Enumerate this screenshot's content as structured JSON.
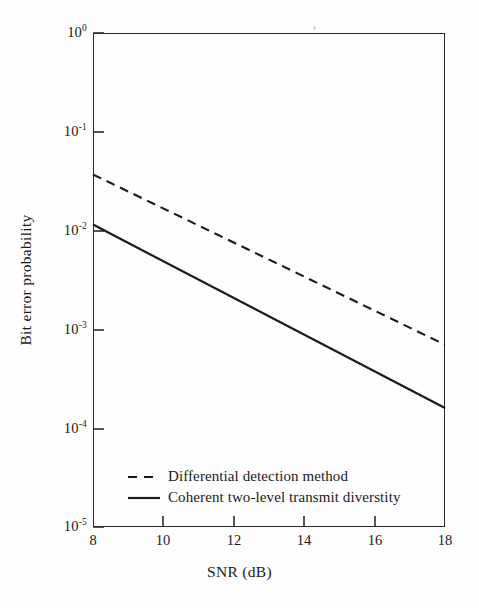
{
  "figure": {
    "background_color": "#fefefe",
    "ink_color": "#1a1a1a"
  },
  "chart_data": {
    "type": "line",
    "title": "",
    "subtitle": "",
    "xlabel": "SNR (dB)",
    "ylabel": "Bit error probability",
    "xscale": "linear",
    "yscale": "log",
    "xlim": [
      8,
      18
    ],
    "ylim": [
      1e-05,
      1
    ],
    "grid": false,
    "legend_position": "inside lower-left",
    "xticks": [
      8,
      10,
      12,
      14,
      16,
      18
    ],
    "xtick_labels": [
      "8",
      "10",
      "12",
      "14",
      "16",
      "18"
    ],
    "yticks": [
      1,
      0.1,
      0.01,
      0.001,
      0.0001,
      1e-05
    ],
    "ytick_labels": [
      "10",
      "10",
      "10",
      "10",
      "10",
      "10"
    ],
    "ytick_exponents": [
      "0",
      "-1",
      "-2",
      "-3",
      "-4",
      "-5"
    ],
    "series": [
      {
        "name": "Differential detection method",
        "style": "dashed",
        "color": "#1a1a1a",
        "x": [
          8,
          18
        ],
        "y": [
          0.037,
          0.0007
        ]
      },
      {
        "name": "Coherent two-level transmit diverstity",
        "style": "solid",
        "color": "#1a1a1a",
        "x": [
          8,
          18
        ],
        "y": [
          0.0115,
          0.00016
        ]
      }
    ]
  },
  "axes": {
    "x_title": "SNR (dB)",
    "y_title": "Bit error probability",
    "x_tick_labels": [
      "8",
      "10",
      "12",
      "14",
      "16",
      "18"
    ],
    "y_tick_mantissa": "10",
    "y_tick_exponents": [
      "0",
      "-1",
      "-2",
      "-3",
      "-4",
      "-5"
    ]
  },
  "legend": {
    "entries": [
      {
        "label": "Differential detection method",
        "style": "dashed"
      },
      {
        "label": "Coherent two-level transmit diverstity",
        "style": "solid"
      }
    ]
  }
}
